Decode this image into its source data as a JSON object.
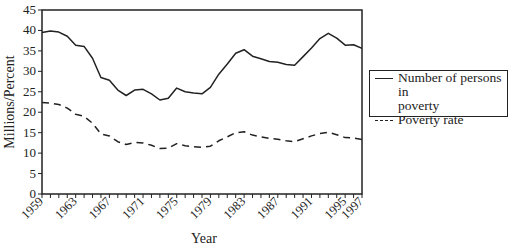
{
  "chart_data": {
    "type": "line",
    "title": "",
    "xlabel": "Year",
    "ylabel": "Millions/Percent",
    "ylim": [
      0,
      45
    ],
    "xlim": [
      1959,
      1997
    ],
    "yticks": [
      0,
      5,
      10,
      15,
      20,
      25,
      30,
      35,
      40,
      45
    ],
    "xtick_labels": [
      "1959",
      "1963",
      "1967",
      "1971",
      "1975",
      "1979",
      "1983",
      "1987",
      "1991",
      "1995",
      "1997"
    ],
    "grid": false,
    "legend_position": "right",
    "x": [
      1959,
      1960,
      1961,
      1962,
      1963,
      1964,
      1965,
      1966,
      1967,
      1968,
      1969,
      1970,
      1971,
      1972,
      1973,
      1974,
      1975,
      1976,
      1977,
      1978,
      1979,
      1980,
      1981,
      1982,
      1983,
      1984,
      1985,
      1986,
      1987,
      1988,
      1989,
      1990,
      1991,
      1992,
      1993,
      1994,
      1995,
      1996,
      1997
    ],
    "series": [
      {
        "name": "Number of persons in poverty",
        "style": "solid",
        "values": [
          39.5,
          39.9,
          39.6,
          38.6,
          36.4,
          36.1,
          33.2,
          28.5,
          27.8,
          25.4,
          24.1,
          25.4,
          25.6,
          24.5,
          23.0,
          23.4,
          25.9,
          25.0,
          24.7,
          24.5,
          26.1,
          29.3,
          31.8,
          34.4,
          35.3,
          33.7,
          33.1,
          32.4,
          32.2,
          31.7,
          31.5,
          33.6,
          35.7,
          38.0,
          39.3,
          38.1,
          36.4,
          36.5,
          35.6
        ]
      },
      {
        "name": "Poverty rate",
        "style": "dashed",
        "values": [
          22.4,
          22.2,
          21.9,
          21.0,
          19.5,
          19.0,
          17.3,
          14.7,
          14.2,
          12.8,
          12.1,
          12.6,
          12.5,
          11.9,
          11.1,
          11.2,
          12.3,
          11.8,
          11.6,
          11.4,
          11.7,
          13.0,
          14.0,
          15.0,
          15.2,
          14.4,
          14.0,
          13.6,
          13.4,
          13.0,
          12.8,
          13.5,
          14.2,
          14.8,
          15.1,
          14.5,
          13.8,
          13.7,
          13.3
        ]
      }
    ]
  },
  "legend": {
    "line1": "Number of persons in",
    "line2": "poverty",
    "line3": "Poverty rate"
  }
}
